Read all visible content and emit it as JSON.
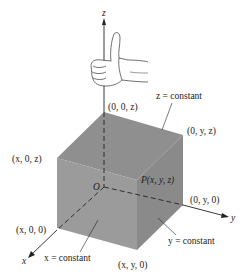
{
  "diagram": {
    "axes": {
      "x": "x",
      "y": "y",
      "z": "z",
      "origin": "O"
    },
    "points": {
      "p_top_back": "(0, 0, z)",
      "p_top_left": "(x, 0, z)",
      "p_top_right": "(0, y, z)",
      "p_point": "P(x, y, z)",
      "p_bottom_left": "(x, 0, 0)",
      "p_bottom_front": "(x, y, 0)",
      "p_bottom_right": "(0, y, 0)"
    },
    "planes": {
      "z_const": "z = constant",
      "x_const": "x = constant",
      "y_const": "y = constant"
    },
    "colors": {
      "face_top": "#8f8f8f",
      "face_left": "#9a9a9a",
      "face_right": "#8a8a8a",
      "line": "#222222"
    },
    "decoration": "right-hand-thumb-icon"
  }
}
